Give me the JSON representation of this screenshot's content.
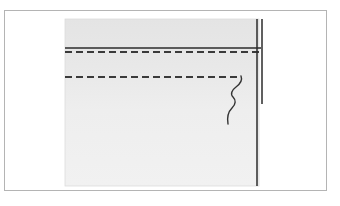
{
  "document": {
    "kind": "scanned-line-drawing",
    "title": "Scanned technical line drawing",
    "caption": "Light gray rectangular panel with a solid horizontal rule, two long horizontal dashed rules, a doubled vertical edge line at the right, and an S-shaped break line descending from the lower dashed rule.",
    "canvas": {
      "width": 340,
      "height": 206,
      "background_color": "#ffffff"
    }
  },
  "colors": {
    "page_background": "#ffffff",
    "frame_border": "#b4b4b4",
    "panel_fill_upper": "#e6e6e6",
    "panel_fill_lower": "#efefef",
    "panel_edge": "#dcdcdc",
    "ink_dark": "#2b2b2b",
    "ink_dashed": "#3a3a3a",
    "ink_squiggle": "#333333"
  },
  "frame": {
    "label": "page-frame",
    "x": 4,
    "y": 10,
    "width": 323,
    "height": 181,
    "stroke_width": 1
  },
  "panel": {
    "label": "gray-panel",
    "x": 65,
    "y": 19,
    "width": 194,
    "height": 167
  },
  "strokes": {
    "solid_rule": {
      "label": "solid-horizontal-rule",
      "x1": 65,
      "y1": 48,
      "x2": 261,
      "y2": 48,
      "stroke_width": 1.6
    },
    "dashed_rule_upper": {
      "label": "upper-dashed-rule",
      "x1": 65,
      "y1": 52,
      "x2": 261,
      "y2": 52,
      "stroke_width": 1.7,
      "dash_pattern": "7 4"
    },
    "dashed_rule_lower": {
      "label": "lower-dashed-rule",
      "x1": 65,
      "y1": 77,
      "x2": 240,
      "y2": 77,
      "stroke_width": 1.7,
      "dash_pattern": "7 4"
    },
    "vertical_inner": {
      "label": "inner-vertical-edge",
      "x1": 257,
      "y1": 19,
      "x2": 257,
      "y2": 186,
      "stroke_width": 1.4
    },
    "vertical_outer": {
      "label": "outer-vertical-edge",
      "x1": 262,
      "y1": 19,
      "x2": 262,
      "y2": 104,
      "stroke_width": 1.4
    },
    "squiggle": {
      "label": "break-line-squiggle",
      "path": "M 241 76 C 243 81, 240 84, 236 87 C 232 90, 230 94, 233 97 C 236 100, 236 104, 232 108 C 228 112, 227 118, 228 124",
      "stroke_width": 1.4
    }
  }
}
